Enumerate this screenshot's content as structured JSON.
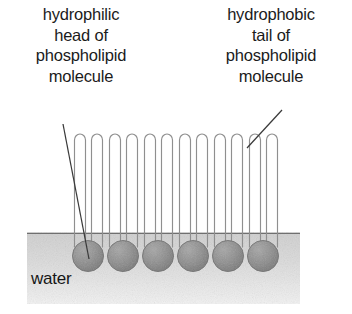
{
  "figure": {
    "kind": "phospholipid-monolayer-at-water-surface",
    "labels": {
      "head": "hydrophilic\nhead of\nphospholipid\nmolecule",
      "tail": "hydrophobic\ntail of\nphospholipid\nmolecule",
      "water": "water"
    },
    "colors": {
      "ink": "#1b1b1b",
      "head_fill": "#8d8d8d",
      "head_edge": "#6a6a6a",
      "water_fill": "#d8d8d8",
      "water_surface": "#6f6f6f",
      "tail_stroke": "#8f8f8f",
      "leader_stroke": "#3a3a3a",
      "background": "#ffffff"
    },
    "water": {
      "x": 27,
      "y": 232,
      "width": 273,
      "height": 72,
      "surface_line_y": 233
    },
    "heads": {
      "count": 6,
      "radius": 15.5,
      "center_y": 256,
      "centers_x": [
        88,
        123,
        158,
        193,
        228,
        263
      ]
    },
    "tails": {
      "per_molecule": 2,
      "total": 12,
      "top_y": 133,
      "base_y": 247,
      "loop_width": 11,
      "offsets_from_head": [
        -9,
        9
      ]
    },
    "leaders": [
      {
        "name": "head-leader",
        "x1": 63,
        "y1": 124,
        "x2": 89,
        "y2": 259
      },
      {
        "name": "tail-leader",
        "x1": 282,
        "y1": 110,
        "x2": 247,
        "y2": 148
      }
    ]
  }
}
